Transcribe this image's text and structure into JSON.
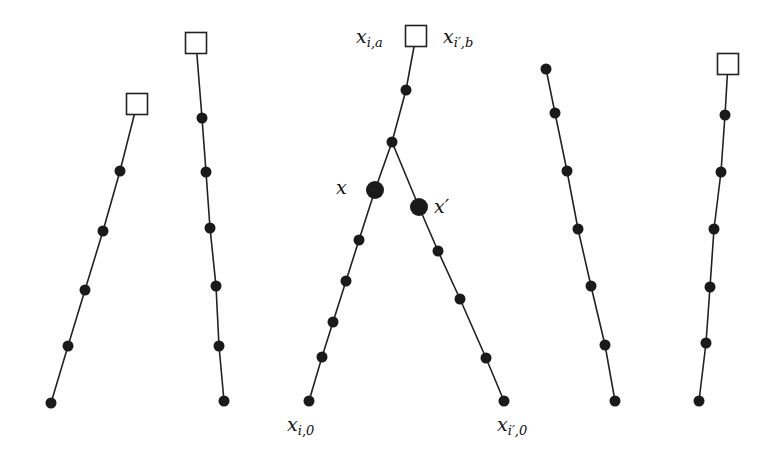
{
  "diagram": {
    "colors": {
      "line": "#222222",
      "node": "#1a1a1a",
      "square_fill": "#ffffff",
      "square_stroke": "#222222",
      "background": "#ffffff"
    },
    "paths": [
      {
        "id": "path-1",
        "top": {
          "shape": "square",
          "x": 137,
          "y": 104
        },
        "dots": [
          [
            120,
            171
          ],
          [
            103,
            231
          ],
          [
            85,
            290
          ],
          [
            68,
            346
          ],
          [
            51,
            403
          ]
        ]
      },
      {
        "id": "path-2",
        "top": {
          "shape": "square",
          "x": 196,
          "y": 43
        },
        "dots": [
          [
            202,
            118
          ],
          [
            206,
            172
          ],
          [
            210,
            228
          ],
          [
            216,
            286
          ],
          [
            219,
            346
          ],
          [
            224,
            401
          ]
        ]
      },
      {
        "id": "path-center-trunk",
        "top": {
          "shape": "square",
          "x": 416,
          "y": 36
        },
        "dots": [
          [
            406,
            90
          ],
          [
            392,
            142
          ]
        ]
      },
      {
        "id": "path-center-left",
        "from": [
          392,
          142
        ],
        "big_dot": {
          "x": 375,
          "y": 190
        },
        "dots": [
          [
            359,
            240
          ],
          [
            346,
            281
          ],
          [
            333,
            322
          ],
          [
            322,
            357
          ],
          [
            309,
            401
          ]
        ]
      },
      {
        "id": "path-center-right",
        "from": [
          392,
          142
        ],
        "big_dot": {
          "x": 419,
          "y": 207
        },
        "dots": [
          [
            438,
            251
          ],
          [
            460,
            299
          ],
          [
            486,
            358
          ],
          [
            504,
            401
          ]
        ]
      },
      {
        "id": "path-5",
        "top": {
          "shape": "dot",
          "x": 546,
          "y": 69
        },
        "dots": [
          [
            555,
            113
          ],
          [
            567,
            171
          ],
          [
            578,
            229
          ],
          [
            591,
            286
          ],
          [
            605,
            345
          ],
          [
            615,
            401
          ]
        ]
      },
      {
        "id": "path-6",
        "top": {
          "shape": "square",
          "x": 728,
          "y": 64
        },
        "dots": [
          [
            725,
            115
          ],
          [
            721,
            172
          ],
          [
            714,
            229
          ],
          [
            710,
            287
          ],
          [
            706,
            343
          ],
          [
            699,
            401
          ]
        ]
      }
    ],
    "labels": {
      "x_ia": {
        "base": "x",
        "sub": "i,a"
      },
      "x_ipb": {
        "base": "x",
        "sub": "i′,b"
      },
      "x": {
        "base": "x",
        "sub": ""
      },
      "x_prime": {
        "base": "x′",
        "sub": ""
      },
      "x_i0": {
        "base": "x",
        "sub": "i,0"
      },
      "x_ip0": {
        "base": "x",
        "sub": "i′,0"
      }
    }
  }
}
